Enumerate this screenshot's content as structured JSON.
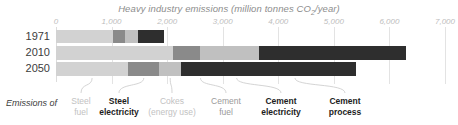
{
  "chart_data": {
    "type": "bar",
    "orientation": "horizontal",
    "stacked": true,
    "title": "Heavy industry emissions (million tonnes CO2/year)",
    "title_main": "Heavy industry emissions (million tonnes CO",
    "title_sub": "2",
    "title_tail": "/year)",
    "xlabel": "",
    "ylabel": "",
    "xlim": [
      0,
      7000
    ],
    "grid": true,
    "legend_position": "bottom",
    "tick_labels": [
      "0",
      "1,000",
      "2,000",
      "3,000",
      "4,000",
      "5,000",
      "6,000",
      "7,000"
    ],
    "tick_values": [
      0,
      1000,
      2000,
      3000,
      4000,
      5000,
      6000,
      7000
    ],
    "categories": [
      "1971",
      "2010",
      "2050"
    ],
    "series": [
      {
        "name": "Steel fuel",
        "color": "#d2d2d2",
        "values": [
          1030,
          2100,
          1300
        ]
      },
      {
        "name": "Steel electricity",
        "color": "#8a8a8a",
        "values": [
          210,
          500,
          560
        ]
      },
      {
        "name": "Cokes (energy use)",
        "color": "#c0c0c0",
        "values": [
          240,
          1050,
          390
        ]
      },
      {
        "name": "Cement fuel",
        "color": "#aaaaaa",
        "values": [
          0,
          0,
          0
        ]
      },
      {
        "name": "Cement electricity",
        "color": "#6f6f6f",
        "values": [
          0,
          0,
          0
        ]
      },
      {
        "name": "Cement process",
        "color": "#2e2e2e",
        "values": [
          460,
          2650,
          3150
        ]
      }
    ],
    "totals": [
      1940,
      6300,
      5400
    ],
    "legend_entries": [
      {
        "label_line1": "Steel",
        "label_line2": "fuel",
        "weight": "light"
      },
      {
        "label_line1": "Steel",
        "label_line2": "electricity",
        "weight": "bold"
      },
      {
        "label_line1": "Cokes",
        "label_line2": "(energy use)",
        "weight": "light"
      },
      {
        "label_line1": "Cement",
        "label_line2": "fuel",
        "weight": "mid"
      },
      {
        "label_line1": "Cement",
        "label_line2": "electricity",
        "weight": "bold"
      },
      {
        "label_line1": "Cement",
        "label_line2": "process",
        "weight": "bold"
      }
    ],
    "annotation": "Emissions of"
  }
}
